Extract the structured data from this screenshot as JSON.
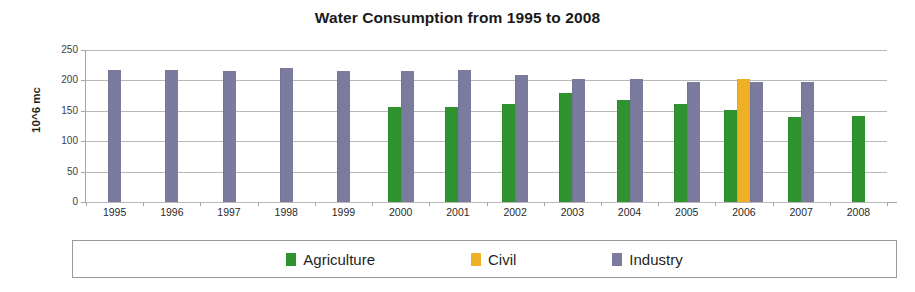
{
  "chart_data": {
    "type": "bar",
    "title": "Water Consumption from 1995 to 2008",
    "xlabel": "",
    "ylabel": "10^6 mc",
    "ylim": [
      0,
      250
    ],
    "yticks": [
      0,
      50,
      100,
      150,
      200,
      250
    ],
    "grid": true,
    "legend_position": "bottom",
    "categories": [
      "1995",
      "1996",
      "1997",
      "1998",
      "1999",
      "2000",
      "2001",
      "2002",
      "2003",
      "2004",
      "2005",
      "2006",
      "2007",
      "2008"
    ],
    "series": [
      {
        "name": "Agriculture",
        "color": "#2f9330",
        "values": [
          null,
          null,
          null,
          null,
          null,
          157,
          157,
          162,
          180,
          168,
          161,
          152,
          140,
          142
        ]
      },
      {
        "name": "Civil",
        "color": "#f0b026",
        "values": [
          null,
          null,
          null,
          null,
          null,
          null,
          null,
          null,
          null,
          null,
          null,
          202,
          null,
          null
        ]
      },
      {
        "name": "Industry",
        "color": "#7b7b9e",
        "values": [
          217,
          217,
          215,
          221,
          215,
          216,
          217,
          209,
          203,
          203,
          197,
          197,
          197,
          null
        ]
      }
    ]
  },
  "legend": {
    "items": [
      {
        "label": "Agriculture",
        "key": "agriculture"
      },
      {
        "label": "Civil",
        "key": "civil"
      },
      {
        "label": "Industry",
        "key": "industry"
      }
    ]
  }
}
